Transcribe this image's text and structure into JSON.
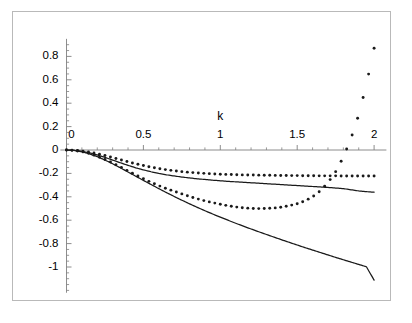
{
  "figure": {
    "title": "",
    "background_color": "#ffffff",
    "frame_color": "#b9b9b9",
    "axis_color": "#808080",
    "curve_color": "#1a1a1a"
  },
  "chart_data": {
    "type": "line",
    "title": "",
    "xlabel": "k",
    "ylabel": "",
    "xlim": [
      -0.04,
      2.08
    ],
    "ylim": [
      -1.22,
      0.95
    ],
    "grid": false,
    "legend": "none",
    "xticks": [
      0,
      0.5,
      1,
      1.5,
      2
    ],
    "xtick_labels": [
      "0",
      "0.5",
      "1",
      "1.5",
      "2"
    ],
    "xminor_step": 0.1,
    "yticks": [
      0.8,
      0.6,
      0.4,
      0.2,
      0,
      -0.2,
      -0.4,
      -0.6,
      -0.8,
      -1
    ],
    "ytick_labels": [
      "0.8",
      "0.6",
      "0.4",
      "0.2",
      "0",
      "-0.2",
      "-0.4",
      "-0.6",
      "-0.8",
      "-1"
    ],
    "yminor_step": 0.05,
    "axis_origin": [
      0,
      0
    ],
    "series": [
      {
        "name": "upper-dotted-curve",
        "style": "dotted",
        "marker": "dot",
        "x": [
          0,
          0.05,
          0.1,
          0.15,
          0.2,
          0.25,
          0.3,
          0.35,
          0.4,
          0.45,
          0.5,
          0.55,
          0.6,
          0.65,
          0.7,
          0.75,
          0.8,
          0.85,
          0.9,
          0.95,
          1,
          1.05,
          1.1,
          1.15,
          1.2,
          1.25,
          1.3,
          1.35,
          1.4,
          1.45,
          1.5,
          1.55,
          1.6,
          1.65,
          1.7,
          1.75,
          1.8,
          1.85,
          1.9,
          1.95,
          2
        ],
        "y": [
          0.0,
          -0.002,
          -0.008,
          -0.018,
          -0.031,
          -0.047,
          -0.065,
          -0.083,
          -0.101,
          -0.118,
          -0.133,
          -0.147,
          -0.159,
          -0.169,
          -0.178,
          -0.185,
          -0.191,
          -0.196,
          -0.2,
          -0.204,
          -0.207,
          -0.209,
          -0.211,
          -0.213,
          -0.214,
          -0.215,
          -0.216,
          -0.217,
          -0.218,
          -0.219,
          -0.219,
          -0.22,
          -0.22,
          -0.221,
          -0.221,
          -0.221,
          -0.222,
          -0.222,
          -0.222,
          -0.222,
          -0.222
        ]
      },
      {
        "name": "upper-solid-curve",
        "style": "solid",
        "marker": "none",
        "x": [
          0,
          0.05,
          0.1,
          0.15,
          0.2,
          0.25,
          0.3,
          0.35,
          0.4,
          0.45,
          0.5,
          0.55,
          0.6,
          0.65,
          0.7,
          0.75,
          0.8,
          0.85,
          0.9,
          0.95,
          1,
          1.05,
          1.1,
          1.15,
          1.2,
          1.25,
          1.3,
          1.35,
          1.4,
          1.45,
          1.5,
          1.55,
          1.6,
          1.65,
          1.7,
          1.75,
          1.8,
          1.85,
          1.9,
          1.95,
          2
        ],
        "y": [
          0.0,
          -0.003,
          -0.011,
          -0.024,
          -0.042,
          -0.063,
          -0.086,
          -0.109,
          -0.131,
          -0.152,
          -0.17,
          -0.186,
          -0.2,
          -0.212,
          -0.222,
          -0.231,
          -0.239,
          -0.246,
          -0.252,
          -0.258,
          -0.263,
          -0.268,
          -0.272,
          -0.276,
          -0.28,
          -0.284,
          -0.288,
          -0.292,
          -0.296,
          -0.3,
          -0.304,
          -0.308,
          -0.312,
          -0.316,
          -0.32,
          -0.325,
          -0.33,
          -0.34,
          -0.35,
          -0.356,
          -0.361
        ]
      },
      {
        "name": "lower-dotted-curve",
        "style": "dotted",
        "marker": "dot",
        "x": [
          0,
          0.05,
          0.1,
          0.15,
          0.2,
          0.25,
          0.3,
          0.35,
          0.4,
          0.45,
          0.5,
          0.55,
          0.6,
          0.65,
          0.7,
          0.75,
          0.8,
          0.85,
          0.9,
          0.95,
          1,
          1.05,
          1.1,
          1.15,
          1.2,
          1.25,
          1.3,
          1.35,
          1.4,
          1.45,
          1.5,
          1.55,
          1.6,
          1.65,
          1.7,
          1.75,
          1.8,
          1.85,
          1.9,
          1.95,
          2
        ],
        "y": [
          0.0,
          -0.004,
          -0.014,
          -0.031,
          -0.054,
          -0.081,
          -0.112,
          -0.145,
          -0.179,
          -0.213,
          -0.246,
          -0.277,
          -0.305,
          -0.33,
          -0.353,
          -0.375,
          -0.397,
          -0.417,
          -0.435,
          -0.45,
          -0.464,
          -0.477,
          -0.487,
          -0.494,
          -0.499,
          -0.501,
          -0.5,
          -0.496,
          -0.488,
          -0.476,
          -0.459,
          -0.435,
          -0.4,
          -0.35,
          -0.28,
          -0.185,
          -0.06,
          0.1,
          0.3,
          0.56,
          0.87
        ]
      },
      {
        "name": "lower-solid-curve",
        "style": "solid",
        "marker": "none",
        "x": [
          0,
          0.05,
          0.1,
          0.15,
          0.2,
          0.25,
          0.3,
          0.35,
          0.4,
          0.45,
          0.5,
          0.55,
          0.6,
          0.65,
          0.7,
          0.75,
          0.8,
          0.85,
          0.9,
          0.95,
          1,
          1.05,
          1.1,
          1.15,
          1.2,
          1.25,
          1.3,
          1.35,
          1.4,
          1.45,
          1.5,
          1.55,
          1.6,
          1.65,
          1.7,
          1.75,
          1.8,
          1.85,
          1.9,
          1.95,
          2
        ],
        "y": [
          0.0,
          -0.004,
          -0.015,
          -0.033,
          -0.057,
          -0.086,
          -0.118,
          -0.152,
          -0.188,
          -0.224,
          -0.26,
          -0.295,
          -0.33,
          -0.364,
          -0.397,
          -0.429,
          -0.46,
          -0.49,
          -0.519,
          -0.547,
          -0.574,
          -0.6,
          -0.626,
          -0.651,
          -0.675,
          -0.699,
          -0.722,
          -0.745,
          -0.768,
          -0.79,
          -0.812,
          -0.834,
          -0.855,
          -0.876,
          -0.897,
          -0.918,
          -0.938,
          -0.958,
          -0.978,
          -0.998,
          -1.112
        ]
      }
    ]
  }
}
